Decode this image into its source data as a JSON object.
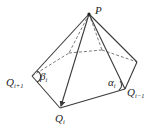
{
  "diagram": {
    "type": "pyramid-geometry",
    "apex": {
      "label": "P",
      "x": 89,
      "y": 14
    },
    "vertices": [
      {
        "id": "q_iplus1",
        "label": "Q",
        "sub": "i+1",
        "x": 32,
        "y": 76
      },
      {
        "id": "q_i",
        "label": "Q",
        "sub": "i",
        "x": 60,
        "y": 108
      },
      {
        "id": "q_iminus1",
        "label": "Q",
        "sub": "i−1",
        "x": 125,
        "y": 89
      },
      {
        "id": "back_right",
        "x": 137,
        "y": 62
      },
      {
        "id": "back_mid",
        "x": 102,
        "y": 50
      },
      {
        "id": "back_left",
        "x": 69,
        "y": 53
      }
    ],
    "angles": [
      {
        "id": "beta",
        "label": "β",
        "sub": "i"
      },
      {
        "id": "alpha",
        "label": "α",
        "sub": "i"
      }
    ],
    "colors": {
      "line": "#3a3a3a",
      "dashed": "#5a5a5a",
      "text": "#222222"
    }
  }
}
